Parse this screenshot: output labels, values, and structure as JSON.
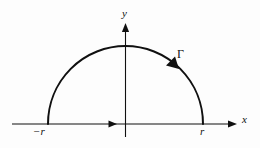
{
  "figure": {
    "name": "semicircular-contour-diagram",
    "type": "math-diagram",
    "background_color": "#fdfdfd",
    "stroke_color": "#101010",
    "width": 260,
    "height": 148
  },
  "axes": {
    "x_axis": {
      "label": "x",
      "label_x": 246,
      "label_y": 120,
      "y_position": 124,
      "start_x": 12,
      "end_x": 237,
      "stroke_width": 1.1,
      "arrow_at_end": true,
      "direction_arrow_x": 113
    },
    "y_axis": {
      "label": "y",
      "label_x": 126,
      "label_y": 14,
      "x_position": 125.5,
      "start_y": 137,
      "end_y": 23,
      "stroke_width": 1.1,
      "arrow_at_end": true
    }
  },
  "contour": {
    "label": "Γ",
    "label_x": 182,
    "label_y": 55,
    "center_x": 125.5,
    "center_y": 124,
    "radius": 77.5,
    "stroke_width": 2.0,
    "orientation": "counterclockwise",
    "arc_arrow_angle_deg": 52
  },
  "tick_labels": {
    "left": "−r",
    "left_x": 43,
    "left_y": 131,
    "right": "r",
    "right_x": 204,
    "right_y": 131
  }
}
